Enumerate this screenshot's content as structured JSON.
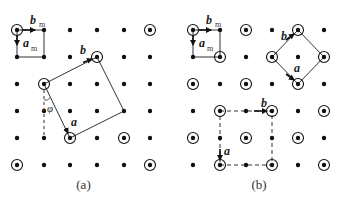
{
  "figure": {
    "panels": [
      {
        "id": "a",
        "caption": "(a)",
        "grid_x": [
          17,
          44,
          70,
          97,
          124,
          150
        ],
        "grid_y": [
          30,
          57,
          84,
          111,
          138,
          165
        ],
        "circled": [
          [
            0,
            0
          ],
          [
            5,
            0
          ],
          [
            1,
            2
          ],
          [
            3,
            1
          ],
          [
            4,
            4
          ],
          [
            2,
            4
          ],
          [
            0,
            5
          ],
          [
            5,
            5
          ]
        ],
        "unit_cell": {
          "corners": [
            [
              0,
              0
            ],
            [
              1,
              0
            ],
            [
              1,
              1
            ],
            [
              0,
              1
            ]
          ],
          "label_b": "b",
          "label_b_sub": "m",
          "label_a": "a",
          "label_a_sub": "m"
        },
        "supercell": {
          "corners": [
            [
              1,
              2
            ],
            [
              3,
              1
            ],
            [
              4,
              3
            ],
            [
              2,
              4
            ]
          ],
          "label_a": "a",
          "label_b": "b",
          "style": "solid"
        },
        "angle_label": "φ"
      },
      {
        "id": "b",
        "caption": "(b)",
        "grid_x": [
          193,
          220,
          246,
          272,
          298,
          324
        ],
        "grid_y": [
          30,
          57,
          84,
          111,
          138,
          165
        ],
        "circled": [
          [
            0,
            0
          ],
          [
            2,
            0
          ],
          [
            4,
            0
          ],
          [
            1,
            1
          ],
          [
            3,
            1
          ],
          [
            5,
            1
          ],
          [
            0,
            2
          ],
          [
            2,
            2
          ],
          [
            4,
            2
          ],
          [
            1,
            3
          ],
          [
            3,
            3
          ],
          [
            5,
            3
          ],
          [
            0,
            4
          ],
          [
            2,
            4
          ],
          [
            4,
            4
          ],
          [
            1,
            5
          ],
          [
            3,
            5
          ],
          [
            5,
            5
          ]
        ],
        "unit_cell": {
          "corners": [
            [
              0,
              0
            ],
            [
              1,
              0
            ],
            [
              1,
              1
            ],
            [
              0,
              1
            ]
          ],
          "label_b": "b",
          "label_b_sub": "m",
          "label_a": "a",
          "label_a_sub": "m"
        },
        "supercell_rotated": {
          "corners": [
            [
              4,
              0
            ],
            [
              5,
              1
            ],
            [
              4,
              2
            ],
            [
              3,
              1
            ]
          ],
          "label_a": "a",
          "label_b": "b",
          "style": "solid"
        },
        "supercell_dashed": {
          "corners": [
            [
              1,
              3
            ],
            [
              3,
              3
            ],
            [
              3,
              5
            ],
            [
              1,
              5
            ]
          ],
          "label_a": "a",
          "label_b": "b",
          "style": "dashed"
        }
      }
    ]
  }
}
